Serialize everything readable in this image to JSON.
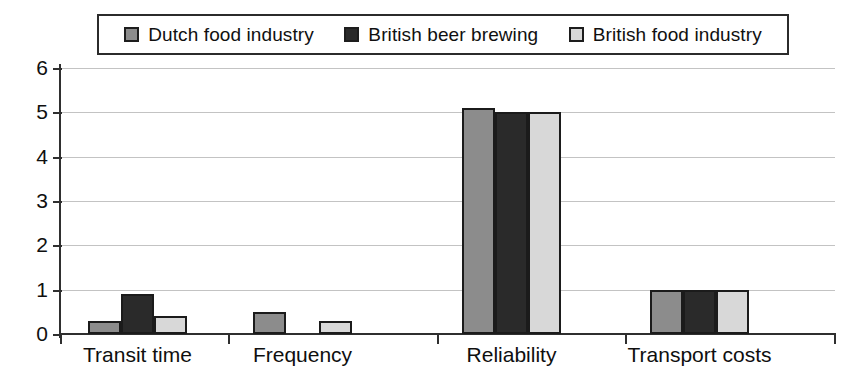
{
  "chart_data": {
    "type": "bar",
    "title": "",
    "subtitle": "",
    "xlabel": "",
    "ylabel": "",
    "ylim": [
      0,
      6
    ],
    "ytick_labels": [
      "6",
      "5",
      "4",
      "3",
      "2",
      "1",
      "0"
    ],
    "ytick_values": [
      6,
      5,
      4,
      3,
      2,
      1,
      0
    ],
    "grid": true,
    "legend_position": "top",
    "categories": [
      "Transit time",
      "Frequency",
      "Reliability",
      "Transport costs"
    ],
    "series": [
      {
        "name": "Dutch food industry",
        "color": "#8c8c8c",
        "values": [
          0.3,
          0.5,
          5.1,
          1.0
        ]
      },
      {
        "name": "British beer brewing",
        "color": "#2a2a2a",
        "values": [
          0.9,
          0,
          5.0,
          1.0
        ]
      },
      {
        "name": "British food industry",
        "color": "#d8d8d8",
        "values": [
          0.4,
          0.3,
          5.0,
          1.0
        ]
      }
    ]
  },
  "legend": {
    "entries": [
      {
        "label": "Dutch food industry",
        "swatch": "legend-swatch-dutch-food-industry"
      },
      {
        "label": "British beer brewing",
        "swatch": "legend-swatch-british-beer-brewing"
      },
      {
        "label": "British food industry",
        "swatch": "legend-swatch-british-food-industry"
      }
    ]
  },
  "colors": {
    "series_1": "#8c8c8c",
    "series_2": "#2a2a2a",
    "series_3": "#d8d8d8",
    "axis": "#2f2f2f",
    "grid": "#b9b9b9",
    "bar_border": "#1b1b1b",
    "background": "#ffffff"
  }
}
